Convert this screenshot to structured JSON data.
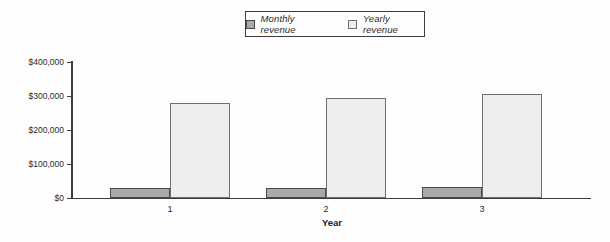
{
  "colors": {
    "monthly_fill": "#a9a9a9",
    "monthly_border": "#4a4a4a",
    "yearly_fill": "#ededed",
    "yearly_border": "#6f6f6f",
    "axis": "#3d3d3d",
    "text": "#2b2b2b"
  },
  "legend": {
    "position": "top-center",
    "items": [
      {
        "label": "Monthly revenue",
        "swatch": "monthly"
      },
      {
        "label": "Yearly revenue",
        "swatch": "yearly"
      }
    ]
  },
  "chart_data": {
    "type": "bar",
    "categories": [
      "1",
      "2",
      "3"
    ],
    "series": [
      {
        "name": "Monthly revenue",
        "values": [
          28000,
          30000,
          32000
        ]
      },
      {
        "name": "Yearly revenue",
        "values": [
          280000,
          293000,
          305000
        ]
      }
    ],
    "title": "",
    "xlabel": "Year",
    "ylabel": "",
    "ylim": [
      0,
      400000
    ],
    "y_ticks": [
      0,
      100000,
      200000,
      300000,
      400000
    ],
    "y_tick_labels": [
      "$0",
      "$100,000",
      "$200,000",
      "$300,000",
      "$400,000"
    ],
    "grid": false,
    "legend_position": "top-center"
  }
}
